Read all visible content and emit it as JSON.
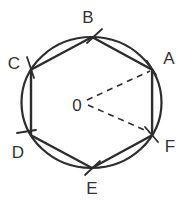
{
  "diagram": {
    "type": "geometry-construction",
    "center_label": "0",
    "vertex_labels": {
      "a": "A",
      "b": "B",
      "c": "C",
      "d": "D",
      "e": "E",
      "f": "F"
    },
    "colors": {
      "stroke": "#2d2d2d",
      "label": "#333333",
      "background": "#ffffff"
    }
  }
}
